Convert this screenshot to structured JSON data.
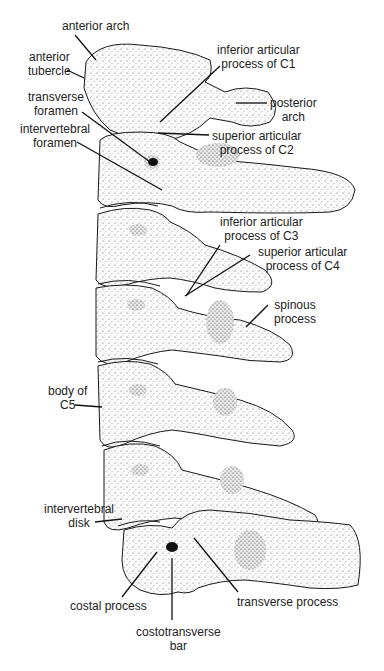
{
  "figure": {
    "labels": {
      "anterior_arch": "anterior arch",
      "anterior_tubercle_1": "anterior",
      "anterior_tubercle_2": "tubercle",
      "inferior_articular_c1_1": "inferior articular",
      "inferior_articular_c1_2": "process of C1",
      "posterior_arch_1": "posterior",
      "posterior_arch_2": "arch",
      "transverse_foramen_1": "transverse",
      "transverse_foramen_2": "foramen",
      "intervertebral_foramen_1": "intervertebral",
      "intervertebral_foramen_2": "foramen",
      "superior_articular_c2_1": "superior articular",
      "superior_articular_c2_2": "process of C2",
      "inferior_articular_c3_1": "inferior articular",
      "inferior_articular_c3_2": "process of C3",
      "superior_articular_c4_1": "superior articular",
      "superior_articular_c4_2": "process of C4",
      "spinous_process_1": "spinous",
      "spinous_process_2": "process",
      "body_c5_1": "body of",
      "body_c5_2": "C5",
      "intervertebral_disk_1": "intervertebral",
      "intervertebral_disk_2": "disk",
      "costal_process": "costal process",
      "transverse_process": "transverse process",
      "costotransverse_bar_1": "costotransverse",
      "costotransverse_bar_2": "bar"
    },
    "colors": {
      "ink": "#1a1a1a",
      "bone": "#f4f4f4",
      "shade": "#333333",
      "background": "#ffffff"
    }
  }
}
